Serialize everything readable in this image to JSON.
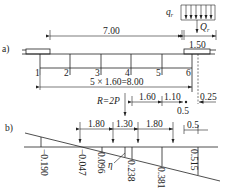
{
  "part_a": {
    "label": "a)",
    "load_q": "q",
    "load_q_sub": "r",
    "load_Q": "Q",
    "load_Q_sub": "r",
    "dim_span": "7.00",
    "dim_sidewalk": "1.50",
    "girders": [
      "1",
      "2",
      "3",
      "4",
      "5",
      "6"
    ],
    "dim_girder_spacing": "5 × 1.60=8.00"
  },
  "mid": {
    "resultant": "R=2P",
    "dim_1": "1.60",
    "dim_2": "1.10",
    "dim_3": "0.25",
    "dim_4": "0.5"
  },
  "part_b": {
    "label": "b)",
    "dims": [
      "1.80",
      "1.30",
      "1.80",
      "0.5"
    ],
    "ordinates": [
      "−0.190",
      "−0.047",
      "0.096",
      "0.238",
      "0.381",
      "0.515"
    ],
    "eta": "η"
  },
  "colors": {
    "line": "#222222",
    "background": "#ffffff"
  }
}
